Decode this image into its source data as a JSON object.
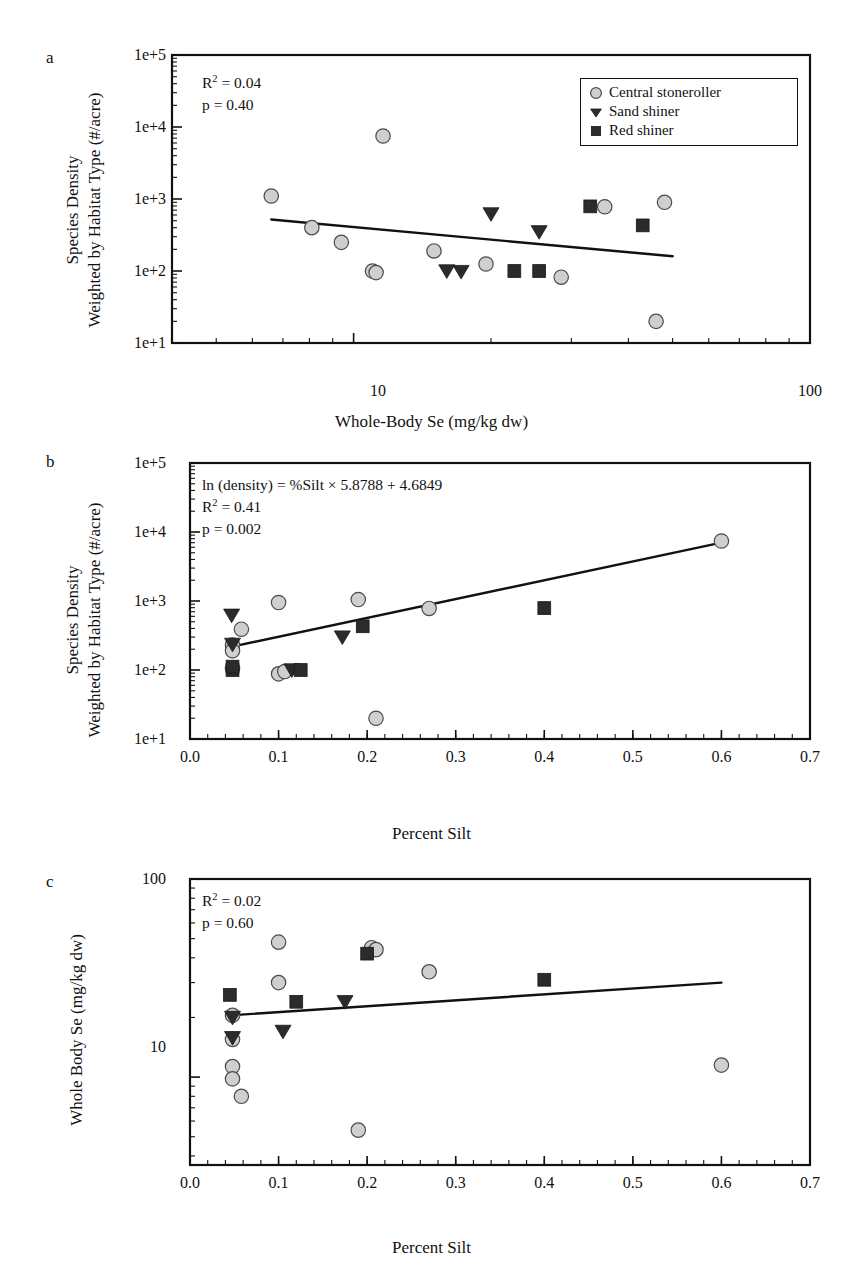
{
  "figure": {
    "panels": [
      "a",
      "b",
      "c"
    ]
  },
  "legend": {
    "items": [
      {
        "label": "Central stoneroller",
        "symbol": "circle",
        "color": "#cfcfcf"
      },
      {
        "label": "Sand shiner",
        "symbol": "triangle-down",
        "color": "#2b2b2b"
      },
      {
        "label": "Red shiner",
        "symbol": "square",
        "color": "#2b2b2b"
      }
    ]
  },
  "chart_data": [
    {
      "panel": "a",
      "type": "scatter",
      "title": "",
      "xlabel": "Whole-Body Se (mg/kg dw)",
      "ylabel": "Species Density\nWeighted by Habitat Type (#/acre)",
      "ylabel_line1": "Species Density",
      "ylabel_line2": "Weighted by Habitat Type (#/acre)",
      "xscale": "log",
      "yscale": "log",
      "xlim": [
        4,
        100
      ],
      "ylim": [
        10,
        100000
      ],
      "xticks": [
        10,
        100
      ],
      "xtick_labels": [
        "10",
        "100"
      ],
      "yticks": [
        10,
        100,
        1000,
        10000,
        100000
      ],
      "ytick_labels": [
        "1e+1",
        "1e+2",
        "1e+3",
        "1e+4",
        "1e+5"
      ],
      "grid": false,
      "annotations": [
        "R2 = 0.04",
        "p = 0.40"
      ],
      "annotation_r2_value": "0.04",
      "annotation_p_value": "0.40",
      "legend_position": "top-right",
      "fit_line": {
        "x": [
          6.6,
          50.0
        ],
        "y": [
          520,
          160
        ]
      },
      "series": [
        {
          "name": "Central stoneroller",
          "symbol": "circle",
          "points": [
            {
              "x": 6.6,
              "y": 1100
            },
            {
              "x": 8.1,
              "y": 400
            },
            {
              "x": 9.4,
              "y": 250
            },
            {
              "x": 11.0,
              "y": 100
            },
            {
              "x": 11.2,
              "y": 95
            },
            {
              "x": 11.6,
              "y": 7500
            },
            {
              "x": 15.0,
              "y": 190
            },
            {
              "x": 19.5,
              "y": 125
            },
            {
              "x": 28.5,
              "y": 82
            },
            {
              "x": 35.5,
              "y": 780
            },
            {
              "x": 48.0,
              "y": 900
            },
            {
              "x": 46.0,
              "y": 20
            }
          ]
        },
        {
          "name": "Sand shiner",
          "symbol": "triangle-down",
          "points": [
            {
              "x": 16.0,
              "y": 100
            },
            {
              "x": 17.2,
              "y": 98
            },
            {
              "x": 20.0,
              "y": 620
            },
            {
              "x": 25.5,
              "y": 350
            }
          ]
        },
        {
          "name": "Red shiner",
          "symbol": "square",
          "points": [
            {
              "x": 22.5,
              "y": 100
            },
            {
              "x": 25.5,
              "y": 100
            },
            {
              "x": 33.0,
              "y": 790
            },
            {
              "x": 43.0,
              "y": 430
            }
          ]
        }
      ]
    },
    {
      "panel": "b",
      "type": "scatter",
      "title": "",
      "xlabel": "Percent Silt",
      "ylabel": "Species Density\nWeighted by Habitat Type (#/acre)",
      "ylabel_line1": "Species Density",
      "ylabel_line2": "Weighted by Habitat Type (#/acre)",
      "xscale": "linear",
      "yscale": "log",
      "xlim": [
        0.0,
        0.7
      ],
      "ylim": [
        10,
        100000
      ],
      "xticks": [
        0.0,
        0.1,
        0.2,
        0.3,
        0.4,
        0.5,
        0.6,
        0.7
      ],
      "xtick_labels": [
        "0.0",
        "0.1",
        "0.2",
        "0.3",
        "0.4",
        "0.5",
        "0.6",
        "0.7"
      ],
      "yticks": [
        10,
        100,
        1000,
        10000,
        100000
      ],
      "ytick_labels": [
        "1e+1",
        "1e+2",
        "1e+3",
        "1e+4",
        "1e+5"
      ],
      "grid": false,
      "annotations": [
        "ln (density) = %Silt × 5.8788 + 4.6849",
        "R2 = 0.41",
        "p = 0.002"
      ],
      "annotation_equation": "ln (density) = %Silt × 5.8788 + 4.6849",
      "annotation_r2_value": "0.41",
      "annotation_p_value": "0.002",
      "legend_position": "none",
      "fit_line": {
        "x": [
          0.045,
          0.6
        ],
        "y": [
          215,
          7000
        ]
      },
      "series": [
        {
          "name": "Central stoneroller",
          "symbol": "circle",
          "points": [
            {
              "x": 0.048,
              "y": 230
            },
            {
              "x": 0.048,
              "y": 190
            },
            {
              "x": 0.048,
              "y": 105
            },
            {
              "x": 0.058,
              "y": 390
            },
            {
              "x": 0.1,
              "y": 950
            },
            {
              "x": 0.1,
              "y": 88
            },
            {
              "x": 0.107,
              "y": 95
            },
            {
              "x": 0.19,
              "y": 1050
            },
            {
              "x": 0.21,
              "y": 20
            },
            {
              "x": 0.27,
              "y": 780
            },
            {
              "x": 0.6,
              "y": 7400
            }
          ]
        },
        {
          "name": "Sand shiner",
          "symbol": "triangle-down",
          "points": [
            {
              "x": 0.047,
              "y": 620
            },
            {
              "x": 0.048,
              "y": 235
            },
            {
              "x": 0.115,
              "y": 100
            },
            {
              "x": 0.172,
              "y": 300
            }
          ]
        },
        {
          "name": "Red shiner",
          "symbol": "square",
          "points": [
            {
              "x": 0.048,
              "y": 100
            },
            {
              "x": 0.048,
              "y": 112
            },
            {
              "x": 0.125,
              "y": 100
            },
            {
              "x": 0.195,
              "y": 430
            },
            {
              "x": 0.4,
              "y": 790
            }
          ]
        }
      ]
    },
    {
      "panel": "c",
      "type": "scatter",
      "title": "",
      "xlabel": "Percent Silt",
      "ylabel": "Whole Body Se (mg/kg dw)",
      "xscale": "linear",
      "yscale": "log",
      "xlim": [
        0.0,
        0.7
      ],
      "ylim": [
        3.6,
        100
      ],
      "xticks": [
        0.0,
        0.1,
        0.2,
        0.3,
        0.4,
        0.5,
        0.6,
        0.7
      ],
      "xtick_labels": [
        "0.0",
        "0.1",
        "0.2",
        "0.3",
        "0.4",
        "0.5",
        "0.6",
        "0.7"
      ],
      "yticks": [
        10,
        100
      ],
      "ytick_labels": [
        "10",
        "100"
      ],
      "grid": false,
      "annotations": [
        "R2 = 0.02",
        "p = 0.60"
      ],
      "annotation_r2_value": "0.02",
      "annotation_p_value": "0.60",
      "legend_position": "none",
      "fit_line": {
        "x": [
          0.045,
          0.6
        ],
        "y": [
          20.5,
          30.0
        ]
      },
      "series": [
        {
          "name": "Central stoneroller",
          "symbol": "circle",
          "points": [
            {
              "x": 0.048,
              "y": 20.5
            },
            {
              "x": 0.048,
              "y": 15.5
            },
            {
              "x": 0.048,
              "y": 11.3
            },
            {
              "x": 0.048,
              "y": 9.8
            },
            {
              "x": 0.058,
              "y": 8.0
            },
            {
              "x": 0.1,
              "y": 48.0
            },
            {
              "x": 0.1,
              "y": 30.0
            },
            {
              "x": 0.19,
              "y": 5.4
            },
            {
              "x": 0.205,
              "y": 45.0
            },
            {
              "x": 0.21,
              "y": 44.0
            },
            {
              "x": 0.27,
              "y": 34.0
            },
            {
              "x": 0.6,
              "y": 11.5
            }
          ]
        },
        {
          "name": "Sand shiner",
          "symbol": "triangle-down",
          "points": [
            {
              "x": 0.048,
              "y": 20.0
            },
            {
              "x": 0.048,
              "y": 15.8
            },
            {
              "x": 0.105,
              "y": 17.0
            },
            {
              "x": 0.175,
              "y": 24.0
            }
          ]
        },
        {
          "name": "Red shiner",
          "symbol": "square",
          "points": [
            {
              "x": 0.045,
              "y": 26.0
            },
            {
              "x": 0.12,
              "y": 24.0
            },
            {
              "x": 0.2,
              "y": 42.0
            },
            {
              "x": 0.4,
              "y": 31.0
            }
          ]
        }
      ]
    }
  ]
}
